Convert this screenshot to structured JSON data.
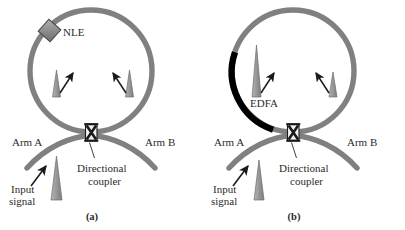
{
  "figure": {
    "background_color": "#ffffff",
    "ring_color": "#808080",
    "amplifier_color": "#000000",
    "element_fill": "#8a8a8a",
    "pulse_fill": "#9a9a9a",
    "arrow_color": "#1a1a1a",
    "text_color": "#2b2b2b"
  },
  "panels": [
    {
      "id": "a",
      "caption": "(a)",
      "ring_element": {
        "name": "NLE",
        "label": "NLE",
        "shape": "diamond"
      },
      "labels": {
        "arm_a": "Arm  A",
        "arm_b": "Arm  B",
        "coupler_line1": "Directional",
        "coupler_line2": "coupler",
        "input_line1": "Input",
        "input_line2": "signal"
      },
      "pulses": {
        "input": {
          "height": 46,
          "width": 13,
          "direction": "into-coupler"
        },
        "ring_left": {
          "height": 27,
          "width": 11,
          "direction": "clockwise"
        },
        "ring_right": {
          "height": 27,
          "width": 11,
          "direction": "counterclockwise"
        }
      }
    },
    {
      "id": "b",
      "caption": "(b)",
      "ring_element": {
        "name": "EDFA",
        "label": "EDFA",
        "shape": "arc-segment"
      },
      "labels": {
        "arm_a": "Arm  A",
        "arm_b": "Arm  B",
        "coupler_line1": "Directional",
        "coupler_line2": "coupler",
        "input_line1": "Input",
        "input_line2": "signal"
      },
      "pulses": {
        "input": {
          "height": 40,
          "width": 12,
          "direction": "into-coupler"
        },
        "ring_left": {
          "height": 52,
          "width": 12,
          "direction": "clockwise"
        },
        "ring_right": {
          "height": 25,
          "width": 10,
          "direction": "counterclockwise"
        }
      }
    }
  ]
}
